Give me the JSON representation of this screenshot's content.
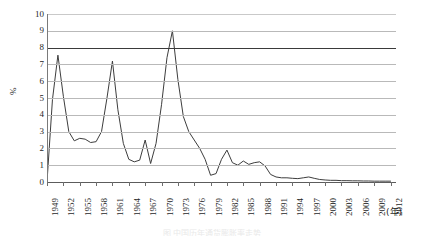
{
  "figure": {
    "background": "#ffffff",
    "line_color": "#3d3d3d",
    "grid_color": "#b9b9b9",
    "emphasis_grid_color": "#3a3a3a",
    "caption": "图 中国历年通货膨胀率走势"
  },
  "chart_data": {
    "type": "line",
    "title": "",
    "subtitle": "",
    "xlabel": "(年)",
    "ylabel": "%",
    "grid": true,
    "legend": "none",
    "xlim": [
      1949,
      2013
    ],
    "ylim": [
      0,
      10
    ],
    "yticks": [
      0,
      1,
      2,
      3,
      4,
      5,
      6,
      7,
      8,
      9,
      10
    ],
    "ytick_labels": [
      "0",
      "1",
      "2",
      "3",
      "4",
      "5",
      "6",
      "7",
      "8",
      "9",
      "10"
    ],
    "xtick_labels": [
      "1949",
      "1952",
      "1955",
      "1958",
      "1961",
      "1964",
      "1967",
      "1970",
      "1973",
      "1976",
      "1979",
      "1982",
      "1985",
      "1988",
      "1991",
      "1994",
      "1997",
      "2000",
      "2003",
      "2006",
      "2009",
      "2012"
    ],
    "xtick_step": 3,
    "emphasis_gridline": 8,
    "series": [
      {
        "name": "rate",
        "x": [
          1949,
          1950,
          1951,
          1952,
          1953,
          1954,
          1955,
          1956,
          1957,
          1958,
          1959,
          1960,
          1961,
          1962,
          1963,
          1964,
          1965,
          1966,
          1967,
          1968,
          1969,
          1970,
          1971,
          1972,
          1973,
          1974,
          1975,
          1976,
          1977,
          1978,
          1979,
          1980,
          1981,
          1982,
          1983,
          1984,
          1985,
          1986,
          1987,
          1988,
          1989,
          1990,
          1991,
          1992,
          1993,
          1994,
          1995,
          1996,
          1997,
          1998,
          1999,
          2000,
          2001,
          2002,
          2003,
          2004,
          2005,
          2006,
          2007,
          2008,
          2009,
          2010,
          2011,
          2012
        ],
        "values": [
          0.0,
          4.9,
          7.55,
          5.1,
          3.0,
          2.45,
          2.6,
          2.55,
          2.35,
          2.4,
          3.0,
          5.0,
          7.2,
          4.3,
          2.3,
          1.35,
          1.2,
          1.3,
          2.5,
          1.1,
          2.3,
          4.6,
          7.4,
          9.0,
          6.1,
          3.9,
          3.0,
          2.5,
          2.0,
          1.35,
          0.4,
          0.5,
          1.35,
          1.9,
          1.15,
          1.0,
          1.25,
          1.05,
          1.15,
          1.2,
          0.95,
          0.45,
          0.3,
          0.25,
          0.25,
          0.22,
          0.2,
          0.25,
          0.3,
          0.22,
          0.15,
          0.12,
          0.1,
          0.1,
          0.08,
          0.08,
          0.07,
          0.07,
          0.06,
          0.06,
          0.05,
          0.05,
          0.05,
          0.05
        ]
      }
    ]
  }
}
